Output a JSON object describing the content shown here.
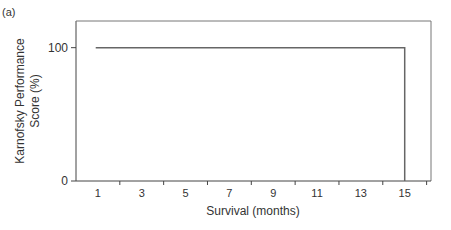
{
  "panel_label": "(a)",
  "chart_data": {
    "type": "line",
    "title": "",
    "panel": "(a)",
    "xlabel": "Survival (months)",
    "ylabel": "Karnofsky Performance Score (%)",
    "ylabel_lines": [
      "Karnofsky Performance",
      "Score (%)"
    ],
    "x_tick_labels": [
      "1",
      "3",
      "5",
      "7",
      "9",
      "11",
      "13",
      "15"
    ],
    "y_tick_labels": [
      "0",
      "100"
    ],
    "xlim": [
      0,
      16.2
    ],
    "ylim": [
      0,
      120
    ],
    "grid": false,
    "legend": null,
    "series": [
      {
        "name": "KPS",
        "x": [
          0.9,
          15,
          15
        ],
        "y": [
          100,
          100,
          0
        ],
        "color": "#555555"
      }
    ]
  },
  "colors": {
    "axis": "#444444",
    "line": "#666666"
  }
}
